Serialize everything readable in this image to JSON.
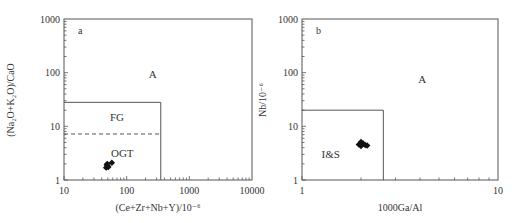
{
  "chart_data": [
    {
      "type": "scatter",
      "panel_label": "a",
      "title": "",
      "xlabel": "(Ce+Zr+Nb+Y)/10⁻⁶",
      "ylabel": "(Na₂O+K₂O)/CaO",
      "xscale": "log",
      "yscale": "log",
      "xlim": [
        10,
        10000
      ],
      "ylim": [
        1,
        1000
      ],
      "xticks": [
        "10",
        "100",
        "1000",
        "10000"
      ],
      "yticks": [
        "1",
        "10",
        "100",
        "1000"
      ],
      "grid": false,
      "fields": [
        {
          "label": "A",
          "x": 260,
          "y": 95
        },
        {
          "label": "FG",
          "x": 70,
          "y": 15
        },
        {
          "label": "OGT",
          "x": 85,
          "y": 3.2
        }
      ],
      "boundaries": [
        {
          "type": "box",
          "x": [
            10,
            350
          ],
          "y": [
            1,
            28
          ],
          "style": "solid"
        },
        {
          "type": "hline",
          "x": [
            10,
            350
          ],
          "y": 7.2,
          "style": "dashed"
        }
      ],
      "series": [
        {
          "name": "samples",
          "marker": "diamond",
          "x": [
            47,
            48,
            50,
            49,
            51,
            58
          ],
          "y": [
            1.7,
            1.9,
            1.8,
            2.0,
            1.75,
            2.1
          ]
        }
      ]
    },
    {
      "type": "scatter",
      "panel_label": "b",
      "title": "",
      "xlabel": "1000Ga/Al",
      "ylabel": "Nb/10⁻⁶",
      "xscale": "log",
      "yscale": "log",
      "xlim": [
        1,
        10
      ],
      "ylim": [
        1,
        1000
      ],
      "xticks": [
        "1",
        "10"
      ],
      "yticks": [
        "1",
        "10",
        "100",
        "1000"
      ],
      "grid": false,
      "fields": [
        {
          "label": "A",
          "x": 4.1,
          "y": 75
        },
        {
          "label": "I&S",
          "x": 1.4,
          "y": 3.0
        }
      ],
      "boundaries": [
        {
          "type": "box",
          "x": [
            1,
            2.6
          ],
          "y": [
            1,
            20
          ],
          "style": "solid"
        }
      ],
      "series": [
        {
          "name": "samples",
          "marker": "diamond",
          "x": [
            1.95,
            2.0,
            2.05,
            2.1,
            2.15,
            2.0
          ],
          "y": [
            4.6,
            5.1,
            4.8,
            4.5,
            4.4,
            4.3
          ]
        }
      ]
    }
  ]
}
